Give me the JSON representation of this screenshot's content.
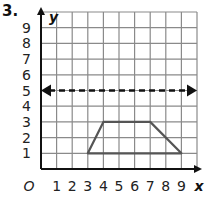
{
  "problem": {
    "number": "3."
  },
  "chart_data": {
    "type": "line",
    "title": "",
    "xlabel": "x",
    "ylabel": "y",
    "origin_label": "O",
    "xlim": [
      0,
      10
    ],
    "ylim": [
      0,
      10
    ],
    "grid": true,
    "x_ticks": [
      "1",
      "2",
      "3",
      "4",
      "5",
      "6",
      "7",
      "8",
      "9"
    ],
    "y_ticks": [
      "1",
      "2",
      "3",
      "4",
      "5",
      "6",
      "7",
      "8",
      "9"
    ],
    "series": [
      {
        "name": "trapezoid",
        "style": "solid",
        "closed": true,
        "points": [
          [
            3,
            1
          ],
          [
            4,
            3
          ],
          [
            7,
            3
          ],
          [
            9,
            1
          ]
        ]
      },
      {
        "name": "line y=5",
        "style": "dashed",
        "arrows": "both",
        "points": [
          [
            0,
            5
          ],
          [
            10,
            5
          ]
        ]
      }
    ],
    "colors": {
      "grid": "#8a8a8a",
      "axis": "#111111",
      "shape": "#555555",
      "dashed": "#111111"
    }
  }
}
